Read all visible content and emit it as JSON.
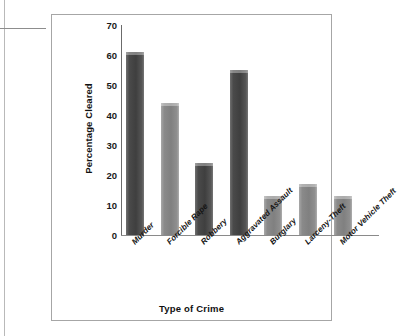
{
  "chart_data": {
    "type": "bar",
    "title": "",
    "xlabel": "Type of Crime",
    "ylabel": "Percentage Cleared",
    "categories": [
      "Murder",
      "Forcible Rape",
      "Robbery",
      "Aggravated Assault",
      "Burglary",
      "Larceny-Theft",
      "Motor Vehicle Theft"
    ],
    "values": [
      61,
      44,
      24,
      55,
      13,
      17,
      13
    ],
    "ylim": [
      0,
      70
    ],
    "ytick_labels": [
      "70",
      "60",
      "50",
      "40",
      "30",
      "20",
      "10",
      "0"
    ],
    "ytick_values": [
      70,
      60,
      50,
      40,
      30,
      20,
      10,
      0
    ],
    "ytick_step": 10,
    "grid": false,
    "legend": "none",
    "bar_colors": [
      "#4a4a4a",
      "#8a8a8a",
      "#4a4a4a",
      "#4a4a4a",
      "#8a8a8a",
      "#8a8a8a",
      "#8a8a8a"
    ],
    "bar_shades": [
      "dark",
      "light",
      "dark",
      "dark",
      "light",
      "light",
      "light"
    ],
    "axis_color": "#6b6b6b",
    "frame_color": "#a6a6a6",
    "text_color": "#111111"
  }
}
